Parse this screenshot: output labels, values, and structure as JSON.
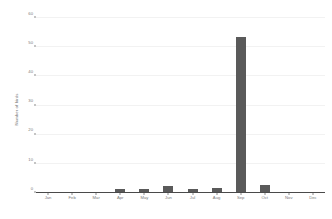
{
  "chart_data": {
    "type": "bar",
    "title": "",
    "subtitle": "",
    "xlabel": "",
    "ylabel": "Number of birds",
    "categories": [
      "Jan",
      "Feb",
      "Mar",
      "Apr",
      "May",
      "Jun",
      "Jul",
      "Aug",
      "Sep",
      "Oct",
      "Nov",
      "Dec"
    ],
    "values": [
      0,
      0,
      0,
      1,
      1,
      2,
      1,
      1.5,
      53,
      2.5,
      0,
      0
    ],
    "series": [
      {
        "name": "Number of birds",
        "values": [
          0,
          0,
          0,
          1,
          1,
          2,
          1,
          1.5,
          53,
          2.5,
          0,
          0
        ]
      }
    ],
    "ylim": [
      0,
      60
    ],
    "yticks": [
      0,
      10,
      20,
      30,
      40,
      50,
      60
    ],
    "ytick_labels": [
      "0",
      "10",
      "20",
      "30",
      "40",
      "50",
      "60"
    ],
    "xtick_labels": [
      "Jan",
      "Feb",
      "Mar",
      "Apr",
      "May",
      "Jun",
      "Jul",
      "Aug",
      "Sep",
      "Oct",
      "Nov",
      "Dec"
    ],
    "grid": true,
    "grid_axis": "y",
    "legend": false,
    "legend_position": "none",
    "annotations": [],
    "colors": {
      "bar": "#5a5a5a",
      "grid": "#f2f2f2",
      "axis": "#4a4a4a",
      "tick_label": "#7a7a7a",
      "axis_title": "#707070",
      "background": "#ffffff"
    }
  }
}
